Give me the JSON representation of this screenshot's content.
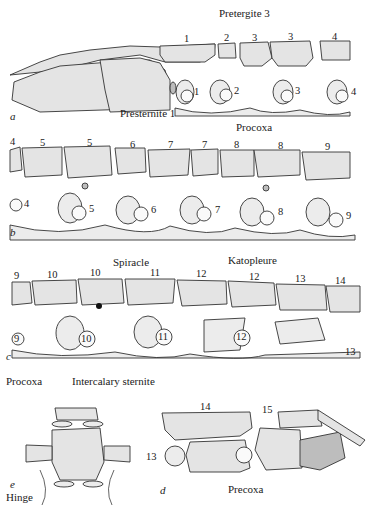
{
  "figure": {
    "panels": [
      {
        "id": "a",
        "label": "a",
        "tergite_numbers": [
          "1",
          "2",
          "3",
          "3",
          "4"
        ],
        "leg_numbers": [
          "1",
          "2",
          "3",
          "4"
        ],
        "annotations": [
          "Pretergite 3",
          "Presternite 1",
          "Procoxa"
        ]
      },
      {
        "id": "b",
        "label": "b",
        "tergite_numbers": [
          "4",
          "5",
          "5",
          "6",
          "7",
          "7",
          "8",
          "8",
          "9"
        ],
        "leg_numbers": [
          "4",
          "5",
          "6",
          "7",
          "8",
          "9"
        ],
        "annotations": []
      },
      {
        "id": "c",
        "label": "c",
        "tergite_numbers": [
          "9",
          "10",
          "10",
          "11",
          "12",
          "12",
          "13",
          "14"
        ],
        "leg_numbers": [
          "9",
          "10",
          "11",
          "12",
          "13"
        ],
        "annotations": [
          "Spiracle",
          "Katopleure",
          "Procoxa",
          "Intercalary sternite"
        ]
      },
      {
        "id": "d",
        "label": "d",
        "tergite_numbers": [
          "14",
          "15"
        ],
        "leg_numbers": [
          "13"
        ],
        "annotations": [
          "Precoxa"
        ]
      },
      {
        "id": "e",
        "label": "e",
        "annotations": [
          "Hinge"
        ]
      }
    ]
  }
}
